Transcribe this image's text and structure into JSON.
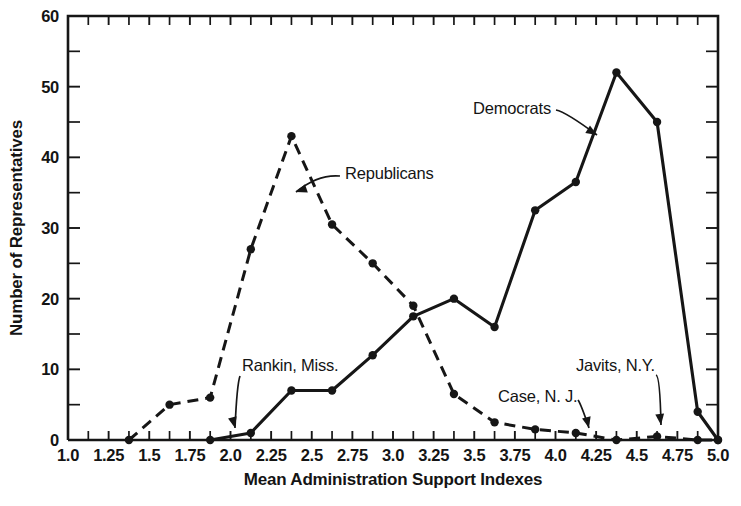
{
  "chart_data": {
    "type": "line",
    "title": "",
    "xlabel": "Mean Administration Support Indexes",
    "ylabel": "Number of Representatives",
    "xlim": [
      1.0,
      5.0
    ],
    "ylim": [
      0,
      60
    ],
    "grid": false,
    "legend_position": "inline-annotations",
    "x_tick_labels": [
      "1.0",
      "1.25",
      "1.5",
      "1.75",
      "2.0",
      "2.25",
      "2.5",
      "2.75",
      "3.0",
      "3.25",
      "3.5",
      "3.75",
      "4.0",
      "4.25",
      "4.5",
      "4.75",
      "5.0"
    ],
    "x_tick_values": [
      1.0,
      1.25,
      1.5,
      1.75,
      2.0,
      2.25,
      2.5,
      2.75,
      3.0,
      3.25,
      3.5,
      3.75,
      4.0,
      4.25,
      4.5,
      4.75,
      5.0
    ],
    "y_tick_labels": [
      "0",
      "10",
      "20",
      "30",
      "40",
      "50",
      "60"
    ],
    "y_tick_values": [
      0,
      10,
      20,
      30,
      40,
      50,
      60
    ],
    "y_minor_ticks": [
      5,
      15,
      25,
      35,
      45,
      55
    ],
    "series": [
      {
        "name": "Republicans",
        "style": "dashed",
        "points": [
          [
            1.375,
            0
          ],
          [
            1.625,
            5
          ],
          [
            1.875,
            6
          ],
          [
            2.125,
            27
          ],
          [
            2.375,
            43
          ],
          [
            2.625,
            30.5
          ],
          [
            2.875,
            25
          ],
          [
            3.125,
            19
          ],
          [
            3.375,
            6.5
          ],
          [
            3.625,
            2.5
          ],
          [
            3.875,
            1.5
          ],
          [
            4.125,
            1
          ],
          [
            4.375,
            0
          ],
          [
            4.625,
            0.5
          ],
          [
            4.875,
            0
          ],
          [
            5.0,
            0
          ]
        ]
      },
      {
        "name": "Democrats",
        "style": "solid",
        "points": [
          [
            1.875,
            0
          ],
          [
            2.125,
            1
          ],
          [
            2.375,
            7
          ],
          [
            2.625,
            7
          ],
          [
            2.875,
            12
          ],
          [
            3.125,
            17.5
          ],
          [
            3.375,
            20
          ],
          [
            3.625,
            16
          ],
          [
            3.875,
            32.5
          ],
          [
            4.125,
            36.5
          ],
          [
            4.375,
            52
          ],
          [
            4.625,
            45
          ],
          [
            4.875,
            4
          ],
          [
            5.0,
            0
          ]
        ]
      }
    ],
    "annotations": [
      {
        "text": "Republicans",
        "target_x": 2.52,
        "target_y": 36.5
      },
      {
        "text": "Democrats",
        "target_x": 4.3,
        "target_y": 47.0
      },
      {
        "text": "Rankin, Miss.",
        "target_x": 2.125,
        "target_y": 1.0
      },
      {
        "text": "Case, N. J.",
        "target_x": 4.125,
        "target_y": 1.0
      },
      {
        "text": "Javits, N.Y.",
        "target_x": 4.625,
        "target_y": 0.5
      }
    ]
  },
  "caption": {
    "partial_text": ""
  }
}
